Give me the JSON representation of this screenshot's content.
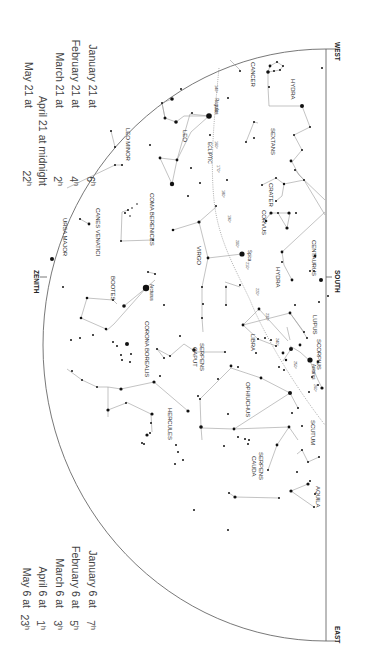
{
  "chart_title": "",
  "orientation": "rotated-90-clockwise",
  "times_top": [
    {
      "date": "January 21 at",
      "time": "6",
      "unit": "h"
    },
    {
      "date": "February 21 at",
      "time": "4",
      "unit": "h"
    },
    {
      "date": "March 21 at",
      "time": "2",
      "unit": "h"
    },
    {
      "date": "April 21 at midnight",
      "time": "",
      "unit": ""
    },
    {
      "date": "May 21 at",
      "time": "22",
      "unit": "h"
    }
  ],
  "times_bottom": [
    {
      "date": "January 6 at",
      "time": "7",
      "unit": "h"
    },
    {
      "date": "February 6 at",
      "time": "5",
      "unit": "h"
    },
    {
      "date": "March 6 at",
      "time": "3",
      "unit": "h"
    },
    {
      "date": "April 6 at",
      "time": "1",
      "unit": "h"
    },
    {
      "date": "May 6 at",
      "time": "23",
      "unit": "h"
    }
  ],
  "directions": {
    "zenith": "ZENITH",
    "west": "WEST",
    "south": "SOUTH",
    "east": "EAST"
  },
  "constellations": {
    "cancer": "CANCER",
    "hydra_w": "HYDRA",
    "leo_minor": "LEO MINOR",
    "leo": "LEO",
    "sextans": "SEXTANS",
    "ursa_major": "URSA MAJOR",
    "canes_venatici": "CANES VENATICI",
    "coma_berenices": "COMA BERENICES",
    "crater": "CRATER",
    "corvus": "CORVUS",
    "virgo": "VIRGO",
    "hydra_s": "HYDRA",
    "centaurus": "CENTAURUS",
    "bootes": "BOOTES",
    "corona_borealis": "CORONA BOREALIS",
    "libra": "LIBRA",
    "lupus": "LUPUS",
    "scorpius": "SCORPIUS",
    "serpens_caput": [
      "SERPENS",
      "CAPUT"
    ],
    "ophiuchus": "OPHIUCHUS",
    "hercules": "HERCULES",
    "serpens_cauda": [
      "SERPENS",
      "CAUDA"
    ],
    "scutum": "SCUTUM",
    "aquila": "AQUILA"
  },
  "stars": {
    "regulus": "Regulus",
    "spica": "Spica",
    "arcturus": "Arcturus",
    "antares": "Antares"
  },
  "ecliptic": {
    "label": "ECLIPTIC",
    "marks": [
      "140°",
      "150°",
      "160°",
      "170°",
      "180°",
      "190°",
      "200°",
      "210°",
      "220°",
      "230°",
      "240°",
      "250°",
      "260°"
    ]
  },
  "colors": {
    "background": "#ffffff",
    "lines": "#9a9a9a",
    "stars": "#111111",
    "horizon": "#555555"
  }
}
